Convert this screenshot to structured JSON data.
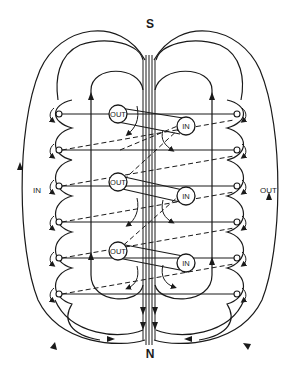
{
  "diagram": {
    "poles": {
      "top": "S",
      "bottom": "N"
    },
    "side_labels": {
      "left": "IN",
      "right": "OUT"
    },
    "conductors": [
      {
        "label": "OUT",
        "position": "upper-left"
      },
      {
        "label": "IN",
        "position": "upper-right"
      },
      {
        "label": "OUT",
        "position": "middle-left"
      },
      {
        "label": "IN",
        "position": "middle-right"
      },
      {
        "label": "OUT",
        "position": "lower-left"
      },
      {
        "label": "IN",
        "position": "lower-right"
      }
    ],
    "terminal_rows": 6,
    "colors": {
      "line": "#1a1a1a",
      "background": "#ffffff"
    }
  }
}
